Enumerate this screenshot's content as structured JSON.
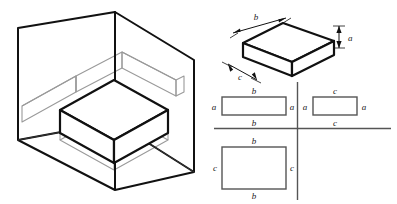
{
  "figure": {
    "title": "",
    "panels": [
      {
        "name": "isometric-projection-box",
        "description": "Open three-wall corner box showing an object and its three orthographic projections"
      },
      {
        "name": "isometric-object",
        "description": "Rectangular slab drawn in isometric with dimension labels"
      },
      {
        "name": "three-view-orthographic",
        "description": "Three orthographic views arranged around crossed axis lines"
      }
    ]
  },
  "isometric_object": {
    "labels": {
      "length": "b",
      "depth": "c",
      "height": "a"
    }
  },
  "orthographic": {
    "front_view": {
      "name": "front-view",
      "top_label": "b",
      "bottom_label": "b",
      "left_label": "a",
      "right_label": "a"
    },
    "side_view": {
      "name": "side-view",
      "top_label": "c",
      "bottom_label": "c",
      "left_label": "a",
      "right_label": "a"
    },
    "top_view": {
      "name": "top-view",
      "top_label": "b",
      "bottom_label": "b",
      "left_label": "c",
      "right_label": "c"
    }
  },
  "colors": {
    "line_dark": "#111111",
    "line_gray": "#9a9a9a",
    "line_medium": "#555555",
    "background": "#ffffff"
  }
}
